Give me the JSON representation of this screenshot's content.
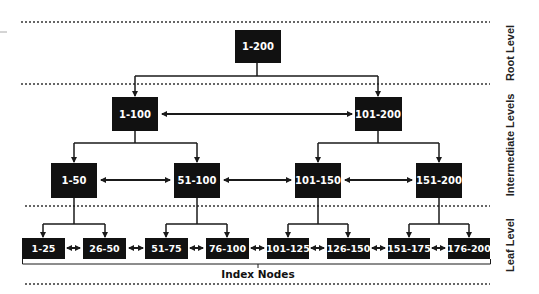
{
  "diagram": {
    "type": "b-tree-index",
    "colors": {
      "node_fill": "#111111",
      "node_text": "#ffffff",
      "line": "#1a1a1a",
      "divider": "#555555"
    },
    "levels": [
      {
        "label": "Root Level"
      },
      {
        "label": "Intermediate Levels"
      },
      {
        "label": "Leaf Level"
      }
    ],
    "root": {
      "label": "1-200"
    },
    "intermediate_1": [
      {
        "label": "1-100"
      },
      {
        "label": "101-200"
      }
    ],
    "intermediate_2": [
      {
        "label": "1-50"
      },
      {
        "label": "51-100"
      },
      {
        "label": "101-150"
      },
      {
        "label": "151-200"
      }
    ],
    "leaves": [
      {
        "label": "1-25"
      },
      {
        "label": "26-50"
      },
      {
        "label": "51-75"
      },
      {
        "label": "76-100"
      },
      {
        "label": "101-125"
      },
      {
        "label": "126-150"
      },
      {
        "label": "151-175"
      },
      {
        "label": "176-200"
      }
    ],
    "leaf_caption": "Index Nodes"
  }
}
